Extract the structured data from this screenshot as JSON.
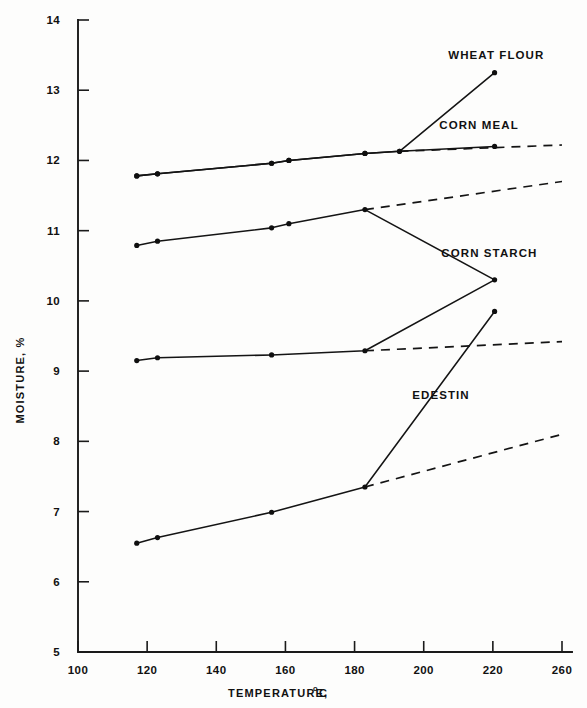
{
  "chart_data": {
    "type": "line",
    "title": "",
    "xlabel": "TEMPERATURE, °C",
    "xlabel_main": "TEMPERATURE,",
    "xlabel_unit_sup": "o",
    "xlabel_unit": "C",
    "ylabel": "MOISTURE, %",
    "xlim": [
      100,
      260
    ],
    "ylim": [
      5,
      14
    ],
    "xticks": [
      100,
      120,
      140,
      160,
      180,
      200,
      220,
      260
    ],
    "xtick_labels": [
      "100",
      "120",
      "140",
      "160",
      "180",
      "200",
      "220",
      "260"
    ],
    "yticks": [
      5,
      6,
      7,
      8,
      9,
      10,
      11,
      12,
      13,
      14
    ],
    "ytick_labels": [
      "5",
      "6",
      "7",
      "8",
      "9",
      "10",
      "11",
      "12",
      "13",
      "14"
    ],
    "grid": false,
    "legend": "inline-labels-right",
    "line_color": "#141414",
    "marker_style": "filled-circle",
    "series": [
      {
        "name": "WHEAT FLOUR",
        "label": "WHEAT FLOUR",
        "label_x": 222,
        "label_y": 13.45,
        "solid_x": [
          117,
          123,
          156,
          161,
          183,
          193,
          221
        ],
        "solid_y": [
          11.78,
          11.81,
          11.96,
          12.0,
          12.1,
          12.13,
          13.25
        ],
        "dashed_x": [],
        "dashed_y": [],
        "marker_x": [
          117,
          123,
          156,
          161,
          183,
          193,
          221
        ],
        "marker_y": [
          11.78,
          11.81,
          11.96,
          12.0,
          12.1,
          12.13,
          13.25
        ]
      },
      {
        "name": "CORN MEAL",
        "label": "CORN MEAL",
        "label_x": 216,
        "label_y": 12.45,
        "solid_x": [
          117,
          123,
          156,
          161,
          183,
          193,
          221
        ],
        "solid_y": [
          11.78,
          11.81,
          11.96,
          12.0,
          12.1,
          12.13,
          12.2
        ],
        "dashed_x": [
          193,
          260
        ],
        "dashed_y": [
          12.13,
          12.22
        ],
        "marker_x": [
          117,
          123,
          156,
          161,
          183,
          193,
          221
        ],
        "marker_y": [
          11.78,
          11.81,
          11.96,
          12.0,
          12.1,
          12.13,
          12.2
        ]
      },
      {
        "name": "CORN STARCH",
        "label": "CORN STARCH",
        "label_x": 219,
        "label_y": 10.62,
        "solid_x": [
          117,
          123,
          156,
          161,
          183,
          221
        ],
        "solid_y": [
          10.79,
          10.85,
          11.04,
          11.1,
          11.3,
          10.3
        ],
        "dashed_x": [
          183,
          260
        ],
        "dashed_y": [
          11.3,
          11.7
        ],
        "marker_x": [
          117,
          123,
          156,
          161,
          183
        ],
        "marker_y": [
          10.79,
          10.85,
          11.04,
          11.1,
          11.3
        ]
      },
      {
        "name": "EDESTIN",
        "label": "EDESTIN",
        "label_x": 205,
        "label_y": 8.6,
        "solid_x": [
          117,
          123,
          156,
          183,
          221
        ],
        "solid_y": [
          9.15,
          9.19,
          9.23,
          9.29,
          10.3
        ],
        "dashed_x": [
          183,
          260
        ],
        "dashed_y": [
          9.29,
          9.42
        ],
        "marker_x": [
          117,
          123,
          156,
          183,
          221
        ],
        "marker_y": [
          9.15,
          9.19,
          9.23,
          9.29,
          10.3
        ]
      },
      {
        "name": "EDESTIN-LOW",
        "label": "",
        "label_x": 0,
        "label_y": 0,
        "solid_x": [
          117,
          123,
          156,
          183,
          221
        ],
        "solid_y": [
          6.55,
          6.63,
          6.99,
          7.35,
          9.85
        ],
        "dashed_x": [
          183,
          260
        ],
        "dashed_y": [
          7.35,
          8.1
        ],
        "marker_x": [
          117,
          123,
          156,
          183,
          221
        ],
        "marker_y": [
          6.55,
          6.63,
          6.99,
          7.35,
          9.85
        ]
      }
    ]
  }
}
